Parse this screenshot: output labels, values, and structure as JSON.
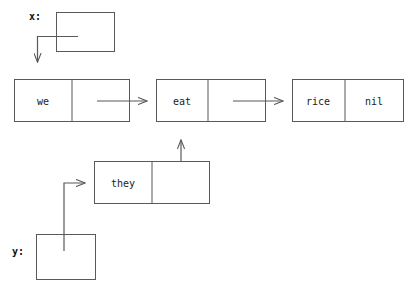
{
  "diagram": {
    "background_color": "#ffffff",
    "stroke_color": "#595959",
    "text_color": "#222222",
    "variables": [
      {
        "id": "x",
        "label": "x:"
      },
      {
        "id": "y",
        "label": "y:"
      }
    ],
    "cons_cells": [
      {
        "id": "cell-we",
        "car": "we",
        "cdr": ""
      },
      {
        "id": "cell-eat",
        "car": "eat",
        "cdr": ""
      },
      {
        "id": "cell-rice",
        "car": "rice",
        "cdr": "nil"
      },
      {
        "id": "cell-they",
        "car": "they",
        "cdr": ""
      }
    ],
    "pointers": [
      {
        "id": "ptr-x-to-we",
        "from": "x",
        "to": "cell-we"
      },
      {
        "id": "ptr-we-to-eat",
        "from": "cell-we",
        "to": "cell-eat"
      },
      {
        "id": "ptr-eat-to-rice",
        "from": "cell-eat",
        "to": "cell-rice"
      },
      {
        "id": "ptr-they-to-eat",
        "from": "cell-they",
        "to": "cell-eat"
      },
      {
        "id": "ptr-y-to-they",
        "from": "y",
        "to": "cell-they"
      }
    ]
  }
}
